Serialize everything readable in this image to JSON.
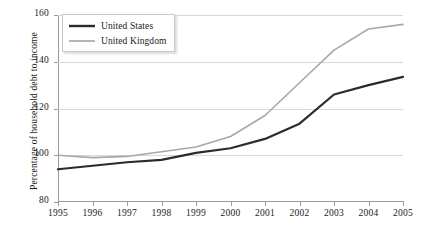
{
  "chart_data": {
    "type": "line",
    "title": "",
    "xlabel": "",
    "ylabel": "Percentage of household debt to income",
    "categories": [
      "1995",
      "1996",
      "1997",
      "1998",
      "1999",
      "2000",
      "2001",
      "2002",
      "2003",
      "2004",
      "2005"
    ],
    "x": [
      1995,
      1996,
      1997,
      1998,
      1999,
      2000,
      2001,
      2002,
      2003,
      2004,
      2005
    ],
    "xlim": [
      1995,
      2005
    ],
    "ylim": [
      80,
      160
    ],
    "yticks": [
      80,
      100,
      120,
      140,
      160
    ],
    "ytick_labels": [
      "80",
      "100",
      "120",
      "140",
      "160"
    ],
    "grid": true,
    "grid_axis": "y",
    "legend_position": "top-left",
    "series": [
      {
        "name": "United States",
        "color": "#2b2b2b",
        "width": 2.2,
        "values": [
          94,
          95.5,
          97,
          98,
          101,
          103,
          107,
          113.5,
          126,
          130,
          133.5
        ]
      },
      {
        "name": "United Kingdom",
        "color": "#a8a8a8",
        "width": 1.6,
        "values": [
          100,
          99,
          99.5,
          101.5,
          103.5,
          108,
          117,
          131,
          145,
          154,
          156
        ]
      }
    ]
  },
  "legend": {
    "items": [
      {
        "label": "United States"
      },
      {
        "label": "United Kingdom"
      }
    ]
  }
}
